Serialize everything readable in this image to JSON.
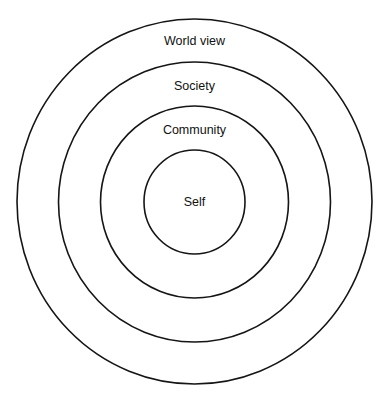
{
  "diagram": {
    "type": "concentric-circles",
    "layers": [
      {
        "label": "World view",
        "cx": 194.5,
        "cy": 201.5,
        "rx": 177.5,
        "ry": 182.5,
        "label_y": 45
      },
      {
        "label": "Society",
        "cx": 194.5,
        "cy": 202,
        "rx": 136,
        "ry": 140,
        "label_y": 90
      },
      {
        "label": "Community",
        "cx": 194.5,
        "cy": 202,
        "rx": 94,
        "ry": 96,
        "label_y": 134
      },
      {
        "label": "Self",
        "cx": 194.5,
        "cy": 202,
        "rx": 50.5,
        "ry": 52,
        "label_y": 206
      }
    ],
    "colors": {
      "stroke": "#151515",
      "text": "#111111",
      "background": "#ffffff"
    }
  }
}
